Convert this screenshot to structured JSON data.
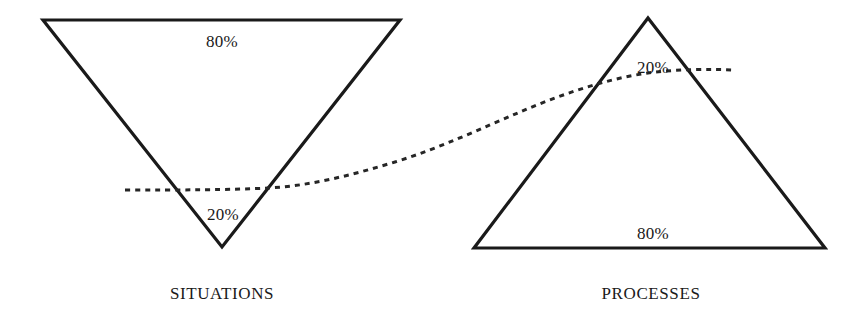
{
  "figure": {
    "background_color": "#ffffff",
    "stroke_color": "#1a1a1a",
    "dotted_curve_color": "#262626"
  },
  "left_shape": {
    "name": "inverted-triangle",
    "caption": "SITUATIONS",
    "top_label": "80%",
    "bottom_label": "20%"
  },
  "right_shape": {
    "name": "upright-triangle",
    "caption": "PROCESSES",
    "top_label": "20%",
    "bottom_label": "80%"
  },
  "chart_data": {
    "type": "diagram",
    "xlabel": "",
    "ylabel": "",
    "grid": false,
    "legend": "none",
    "xlim": [
      0,
      865
    ],
    "ylim": [
      0,
      319
    ],
    "shapes": [
      {
        "id": "situations-triangle",
        "kind": "triangle",
        "orientation": "inverted",
        "points": [
          [
            43,
            20
          ],
          [
            400,
            20
          ],
          [
            222,
            247
          ]
        ],
        "stroke": "#1a1a1a",
        "stroke_width": 3.2,
        "fill": "none",
        "segments": [
          {
            "label": "80%",
            "portion": 80,
            "position": "top",
            "at": [
              222,
              41
            ]
          },
          {
            "label": "20%",
            "portion": 20,
            "position": "bottom",
            "at": [
              223,
              214
            ]
          }
        ],
        "caption": {
          "text": "SITUATIONS",
          "at": [
            222,
            293
          ]
        }
      },
      {
        "id": "processes-triangle",
        "kind": "triangle",
        "orientation": "upright",
        "points": [
          [
            648,
            18
          ],
          [
            825,
            248
          ],
          [
            474,
            248
          ]
        ],
        "stroke": "#1a1a1a",
        "stroke_width": 3.2,
        "fill": "none",
        "segments": [
          {
            "label": "20%",
            "portion": 20,
            "position": "top",
            "at": [
              653,
              67
            ]
          },
          {
            "label": "80%",
            "portion": 80,
            "position": "bottom",
            "at": [
              653,
              233
            ]
          }
        ],
        "caption": {
          "text": "PROCESSES",
          "at": [
            651,
            293
          ]
        }
      }
    ],
    "curves": [
      {
        "id": "connector-dotted-curve",
        "style": "dotted",
        "stroke": "#262626",
        "stroke_width": 3,
        "dash_pattern": [
          5,
          5
        ],
        "path_points": [
          [
            125,
            190
          ],
          [
            200,
            190
          ],
          [
            268,
            189
          ],
          [
            330,
            180
          ],
          [
            395,
            163
          ],
          [
            455,
            140
          ],
          [
            520,
            113
          ],
          [
            580,
            90
          ],
          [
            640,
            74
          ],
          [
            690,
            70
          ],
          [
            733,
            70
          ]
        ],
        "description": "dotted line rising from the 20% band of the inverted Situations triangle to the 20% band of the upright Processes triangle"
      }
    ]
  }
}
